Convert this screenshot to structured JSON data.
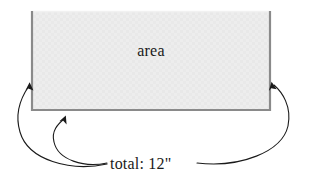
{
  "diagram": {
    "type": "geometry-annotation",
    "background_color": "#ffffff",
    "rectangle": {
      "label": "area",
      "fill_color": "#ececec",
      "border_color": "#8a8a8a",
      "top_border_color": "#f2f2f2",
      "x": 31,
      "y": 11,
      "width": 240,
      "height": 100
    },
    "measurement": {
      "label": "total: 12\"",
      "value": 12,
      "unit": "inches",
      "unit_symbol": "\"",
      "prefix": "total:"
    },
    "annotation_color": "#1a1a1a",
    "arrows": [
      {
        "name": "arrow-to-left-side",
        "from_label": true,
        "points_to": "rectangle-left-edge",
        "arrowhead_x": 30,
        "arrowhead_y": 83
      },
      {
        "name": "arrow-to-bottom-side",
        "from_label": true,
        "points_to": "rectangle-bottom-edge",
        "arrowhead_x": 65,
        "arrowhead_y": 117
      },
      {
        "name": "arrow-to-right-side",
        "from_label": true,
        "points_to": "rectangle-right-edge",
        "arrowhead_x": 272,
        "arrowhead_y": 82
      }
    ]
  }
}
